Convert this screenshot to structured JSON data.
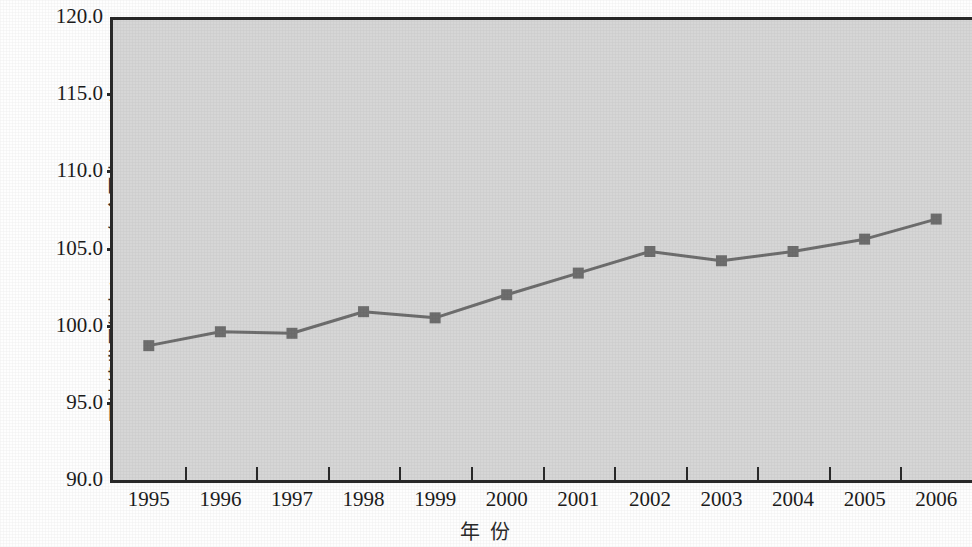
{
  "chart_data": {
    "type": "line",
    "title": "",
    "subtitle": "",
    "xlabel": "年  份",
    "ylabel": "可持续发展能力(1995年全国为100.0)",
    "categories": [
      "1995",
      "1996",
      "1997",
      "1998",
      "1999",
      "2000",
      "2001",
      "2002",
      "2003",
      "2004",
      "2005",
      "2006"
    ],
    "x": [
      1995,
      1996,
      1997,
      1998,
      1999,
      2000,
      2001,
      2002,
      2003,
      2004,
      2005,
      2006
    ],
    "values": [
      98.9,
      99.8,
      99.7,
      101.1,
      100.7,
      102.2,
      103.6,
      105.0,
      104.4,
      105.0,
      105.8,
      107.1
    ],
    "series": [
      {
        "name": "可持续发展能力",
        "values": [
          98.9,
          99.8,
          99.7,
          101.1,
          100.7,
          102.2,
          103.6,
          105.0,
          104.4,
          105.0,
          105.8,
          107.1
        ]
      }
    ],
    "ylim": [
      90.0,
      120.0
    ],
    "ytick_labels": [
      "120.0",
      "115.0",
      "110.0",
      "105.0",
      "100.0",
      "95.0",
      "90.0"
    ],
    "ytick_values": [
      120.0,
      115.0,
      110.0,
      105.0,
      100.0,
      95.0,
      90.0
    ],
    "grid": false,
    "legend": "none",
    "marker": "square",
    "series_color": "#6e6e6e",
    "plot_background": "#d6d6d6",
    "axis_color": "#2a2a2a"
  }
}
